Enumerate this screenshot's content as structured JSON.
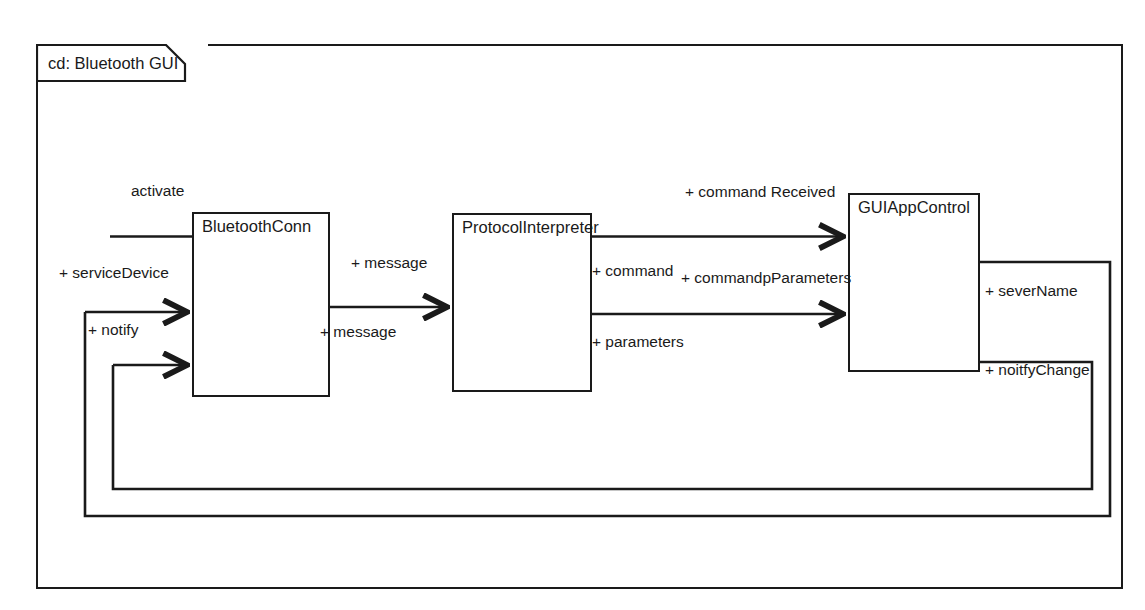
{
  "frame": {
    "label": "cd: Bluetooth GUI",
    "type": "class-diagram-frame"
  },
  "components": [
    {
      "id": "bluetoothConn",
      "name": "BluetoothConn",
      "x": 192,
      "y": 212,
      "w": 138,
      "h": 185
    },
    {
      "id": "protocolInterpreter",
      "name": "ProtocolInterpreter",
      "x": 452,
      "y": 213,
      "w": 140,
      "h": 179
    },
    {
      "id": "guiAppControl",
      "name": "GUIAppControl",
      "x": 848,
      "y": 193,
      "w": 132,
      "h": 179
    }
  ],
  "labels": {
    "activate": "activate",
    "serviceDevice": "+ serviceDevice",
    "notify": "+ notify",
    "messageTop": "+ message",
    "messageBottom": "+ message",
    "commandReceived": "+ command Received",
    "command": "+ command",
    "commandpParameters": "+ commandpParameters",
    "parameters": "+ parameters",
    "severName": "+ severName",
    "noitfyChange": "+ noitfyChange"
  },
  "connectors": [
    {
      "id": "activate-line",
      "label": "activate",
      "from": "external",
      "to": "bluetoothConn",
      "arrow": false
    },
    {
      "id": "serviceDevice-arrow",
      "label": "+ serviceDevice",
      "from": "external",
      "to": "bluetoothConn",
      "arrow": true
    },
    {
      "id": "notify-arrow",
      "label": "+ notify",
      "from": "guiAppControl",
      "to": "bluetoothConn",
      "arrow": true
    },
    {
      "id": "message-arrow",
      "label": "+ message",
      "from": "bluetoothConn",
      "to": "protocolInterpreter",
      "arrow": true
    },
    {
      "id": "commandReceived",
      "label": "+ command Received",
      "from": "protocolInterpreter",
      "to": "guiAppControl",
      "arrow": true
    },
    {
      "id": "parameters-arrow",
      "label": "+ parameters",
      "from": "protocolInterpreter",
      "to": "guiAppControl",
      "arrow": true
    },
    {
      "id": "severName-return",
      "label": "+ severName",
      "from": "guiAppControl",
      "to": "bluetoothConn",
      "arrow": true
    },
    {
      "id": "noitfyChange-return",
      "label": "+ noitfyChange",
      "from": "guiAppControl",
      "to": "bluetoothConn",
      "arrow": true
    }
  ],
  "colors": {
    "stroke": "#1a1a1a",
    "background": "#ffffff",
    "text": "#1a1a1a"
  }
}
